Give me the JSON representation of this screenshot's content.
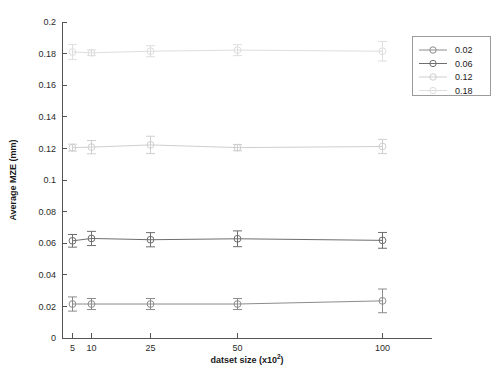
{
  "chart_data": {
    "type": "scatter",
    "title": "",
    "xlabel": "datset size (x10",
    "xlabel_sup": "2",
    "xlabel_tail": ")",
    "ylabel": "Average MZE (mm)",
    "categories": [
      "5",
      "10",
      "25",
      "50",
      "100"
    ],
    "x": [
      5,
      10,
      25,
      50,
      100
    ],
    "xlim": [
      0,
      115
    ],
    "ylim": [
      0,
      0.2
    ],
    "yticks": [
      "0",
      "0.02",
      "0.04",
      "0.06",
      "0.08",
      "0.1",
      "0.12",
      "0.14",
      "0.16",
      "0.18",
      "0.2"
    ],
    "ytick_values": [
      0,
      0.02,
      0.04,
      0.06,
      0.08,
      0.1,
      0.12,
      0.14,
      0.16,
      0.18,
      0.2
    ],
    "xticks": [
      "5",
      "10",
      "25",
      "50",
      "100"
    ],
    "grid": false,
    "legend_position": "upper right",
    "error_bars": true,
    "series": [
      {
        "name": "0.02",
        "color": "#8c8c8c",
        "values": [
          0.0215,
          0.0215,
          0.0215,
          0.0215,
          0.0235
        ],
        "errors": [
          0.0045,
          0.0035,
          0.0035,
          0.0035,
          0.0075
        ]
      },
      {
        "name": "0.06",
        "color": "#6e6e6e",
        "values": [
          0.0615,
          0.063,
          0.0622,
          0.0628,
          0.0618
        ],
        "errors": [
          0.004,
          0.0045,
          0.0045,
          0.005,
          0.005
        ]
      },
      {
        "name": "0.12",
        "color": "#cfcfcf",
        "values": [
          0.1205,
          0.1208,
          0.1222,
          0.1205,
          0.1212
        ],
        "errors": [
          0.0022,
          0.0042,
          0.0055,
          0.002,
          0.0045
        ]
      },
      {
        "name": "0.18",
        "color": "#dedede",
        "values": [
          0.181,
          0.1805,
          0.1815,
          0.1822,
          0.1815
        ],
        "errors": [
          0.0048,
          0.0018,
          0.0035,
          0.0035,
          0.0062
        ]
      }
    ]
  },
  "legend": {
    "entries": [
      {
        "label": "0.02"
      },
      {
        "label": "0.06"
      },
      {
        "label": "0.12"
      },
      {
        "label": "0.18"
      }
    ]
  }
}
